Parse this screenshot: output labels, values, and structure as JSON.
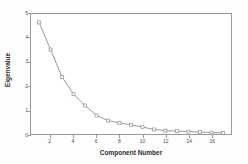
{
  "chart_data": {
    "type": "line",
    "title": "",
    "xlabel": "Component Number",
    "ylabel": "Eigenvalue",
    "x": [
      1,
      2,
      3,
      4,
      5,
      6,
      7,
      8,
      9,
      10,
      11,
      12,
      13,
      14,
      15,
      16,
      17
    ],
    "values": [
      4.65,
      3.52,
      2.38,
      1.66,
      1.19,
      0.77,
      0.56,
      0.46,
      0.38,
      0.29,
      0.19,
      0.14,
      0.12,
      0.1,
      0.08,
      0.06,
      0.05
    ],
    "series": [
      {
        "name": "Eigenvalue",
        "values": [
          4.65,
          3.52,
          2.38,
          1.66,
          1.19,
          0.77,
          0.56,
          0.46,
          0.38,
          0.29,
          0.19,
          0.14,
          0.12,
          0.1,
          0.08,
          0.06,
          0.05
        ]
      }
    ],
    "xlim": [
      0.3,
      17.7
    ],
    "ylim": [
      0,
      5
    ],
    "xticks": [
      2,
      4,
      6,
      8,
      10,
      12,
      14,
      16
    ],
    "xtick_labels": [
      "2",
      "4",
      "6",
      "8",
      "10",
      "12",
      "14",
      "16"
    ],
    "yticks": [
      0,
      1,
      2,
      3,
      4,
      5
    ],
    "ytick_labels": [
      "0",
      "1",
      "2",
      "3",
      "4",
      "5"
    ],
    "grid": false,
    "legend": false,
    "marker": "square",
    "line_color": "#8c8c8c",
    "marker_color": "#9a9a9a",
    "frame_color": "#9a9a9a",
    "plot_background": "#ffffff",
    "page_background": "#fdfdfd"
  }
}
